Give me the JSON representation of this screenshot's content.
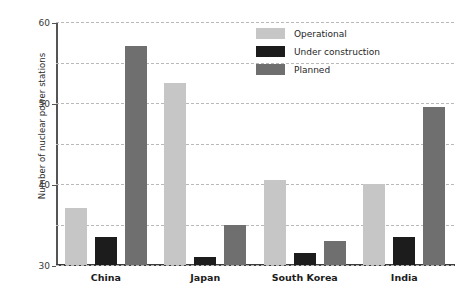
{
  "chart_data": {
    "type": "bar",
    "title": "",
    "xlabel": "",
    "ylabel": "Number of nuclear power stations",
    "categories": [
      "China",
      "Japan",
      "South Korea",
      "India"
    ],
    "series": [
      {
        "name": "Operational",
        "color": "#c6c6c6",
        "values": [
          14,
          45,
          21,
          20
        ]
      },
      {
        "name": "Under construction",
        "color": "#1c1c1c",
        "values": [
          7,
          2,
          3,
          7
        ]
      },
      {
        "name": "Planned",
        "color": "#6f6f6f",
        "values": [
          54,
          10,
          6,
          39
        ]
      }
    ],
    "ylim": [
      0,
      60
    ],
    "yticks": [
      0,
      10,
      20,
      30,
      40,
      50,
      60
    ],
    "ytick_labels": [
      "0",
      "10",
      "20",
      "30",
      "40",
      "50",
      "60"
    ],
    "grid": true,
    "grid_axis": "y",
    "grid_style": "dashed",
    "legend_position": "top-right"
  }
}
